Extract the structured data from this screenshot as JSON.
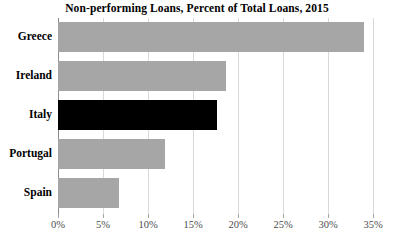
{
  "chart_data": {
    "type": "bar",
    "orientation": "horizontal",
    "title": "Non-performing Loans, Percent of Total Loans, 2015",
    "xlabel": "",
    "ylabel": "",
    "categories": [
      "Greece",
      "Ireland",
      "Italy",
      "Portugal",
      "Spain"
    ],
    "values": [
      34.0,
      18.7,
      17.7,
      11.9,
      6.8
    ],
    "value_unit": "percent",
    "xlim": [
      0,
      35
    ],
    "xticks": [
      0,
      5,
      10,
      15,
      20,
      25,
      30,
      35
    ],
    "xtick_labels": [
      "0%",
      "5%",
      "10%",
      "15%",
      "20%",
      "25%",
      "30%",
      "35%"
    ],
    "grid": true,
    "grid_axis": "x",
    "legend": false,
    "bar_colors": [
      "#a6a6a6",
      "#a6a6a6",
      "#000000",
      "#a6a6a6",
      "#a6a6a6"
    ],
    "highlight_category": "Italy",
    "colors": {
      "bar_default": "#a6a6a6",
      "bar_highlight": "#000000",
      "gridline": "#d9d9d9",
      "axis": "#8c8c8c",
      "text": "#000000",
      "tick_text": "#4d4d4d",
      "background": "#ffffff"
    }
  }
}
